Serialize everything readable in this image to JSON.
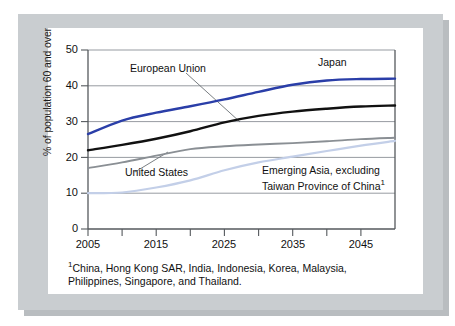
{
  "figure": {
    "ylabel": "% of population 60 and over",
    "footnote_marker": "1",
    "footnote_text": "China, Hong Kong SAR, India, Indonesia, Korea, Malaysia, Philippines, Singapore, and Thailand.",
    "annotations": {
      "european_union": "European Union",
      "japan": "Japan",
      "united_states": "United States",
      "emerging_asia_line1": "Emerging Asia, excluding",
      "emerging_asia_line2": "Taiwan Province of China",
      "emerging_asia_marker": "1"
    },
    "colors": {
      "japan": "#2a3ea8",
      "european_union": "#111111",
      "united_states": "#8a8f94",
      "emerging_asia": "#c3cfe8",
      "gridline": "#8b9096",
      "axis": "#555a5e",
      "mat": "#c9cdd0",
      "card": "#ffffff"
    }
  },
  "chart_data": {
    "type": "line",
    "title": "",
    "xlabel": "",
    "ylabel": "% of population 60 and over",
    "xlim": [
      2005,
      2050
    ],
    "ylim": [
      0,
      50
    ],
    "yticks": [
      0,
      10,
      20,
      30,
      40,
      50
    ],
    "xticks": [
      2005,
      2015,
      2025,
      2035,
      2045
    ],
    "xticks_minor": [
      2010,
      2020,
      2030,
      2040,
      2050
    ],
    "grid": true,
    "legend": "annotated-inline",
    "x": [
      2005,
      2010,
      2015,
      2020,
      2025,
      2030,
      2035,
      2040,
      2045,
      2050
    ],
    "series": [
      {
        "name": "Japan",
        "color": "#2a3ea8",
        "values": [
          26.5,
          30.3,
          32.5,
          34.3,
          36.2,
          38.3,
          40.3,
          41.5,
          41.9,
          42.0
        ]
      },
      {
        "name": "European Union",
        "color": "#111111",
        "values": [
          22.0,
          23.5,
          25.2,
          27.3,
          29.8,
          31.6,
          32.8,
          33.6,
          34.2,
          34.5
        ]
      },
      {
        "name": "United States",
        "color": "#8a8f94",
        "values": [
          17.0,
          18.6,
          20.5,
          22.3,
          23.1,
          23.6,
          24.0,
          24.5,
          25.1,
          25.5
        ]
      },
      {
        "name": "Emerging Asia, excluding Taiwan Province of China",
        "color": "#c3cfe8",
        "values": [
          10.0,
          10.2,
          11.6,
          13.6,
          16.4,
          18.6,
          20.2,
          21.8,
          23.3,
          24.6
        ]
      }
    ]
  }
}
